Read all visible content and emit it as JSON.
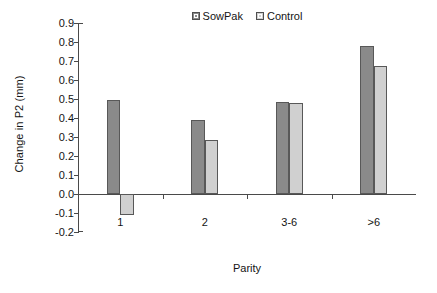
{
  "chart_data": {
    "type": "bar",
    "title": "",
    "xlabel": "Parity",
    "ylabel": "Change in P2 (mm)",
    "categories": [
      "1",
      "2",
      "3-6",
      ">6"
    ],
    "series": [
      {
        "name": "SowPak",
        "color": "#8a8a8a",
        "values": [
          0.495,
          0.39,
          0.485,
          0.78
        ]
      },
      {
        "name": "Control",
        "color": "#d0d0d0",
        "values": [
          -0.11,
          0.285,
          0.48,
          0.675
        ]
      }
    ],
    "ylim": [
      -0.2,
      0.9
    ],
    "ytick_step": 0.1,
    "yticks": [
      0.9,
      0.8,
      0.7,
      0.6,
      0.5,
      0.4,
      0.3,
      0.2,
      0.1,
      0.0,
      -0.1,
      -0.2
    ],
    "ytick_labels": [
      "0.9",
      "0.8",
      "0.7",
      "0.6",
      "0.5",
      "0.4",
      "0.3",
      "0.2",
      "0.1",
      "0.0",
      "-0.1",
      "-0.2"
    ],
    "grid": false,
    "legend_position": "top-center",
    "bar_group_padding": 0.34,
    "axis_color": "#4a4a4a",
    "background": "#ffffff"
  }
}
